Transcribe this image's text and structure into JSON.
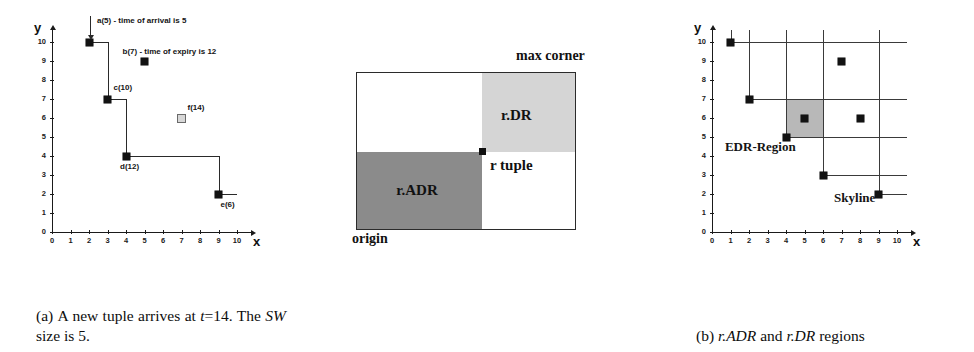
{
  "figure": {
    "panels": [
      {
        "id": "a",
        "caption_label": "(a)",
        "caption_text": "A new tuple arrives at t=14. The SW size is 5.",
        "caption_parts": [
          "(a) A new tuple ar-",
          "rives at ",
          "t",
          "=14. The ",
          "SW",
          " size is 5."
        ],
        "axes": {
          "x_label": "x",
          "y_label": "y",
          "x_ticks": [
            "0",
            "1",
            "2",
            "3",
            "4",
            "5",
            "6",
            "7",
            "8",
            "9",
            "10"
          ],
          "y_ticks": [
            "0",
            "1",
            "2",
            "3",
            "4",
            "5",
            "6",
            "7",
            "8",
            "9",
            "10"
          ],
          "xlim": [
            0,
            10
          ],
          "ylim": [
            0,
            10
          ]
        },
        "annotations": [
          {
            "name": "arrival-note",
            "text": "a(5) - time of arrival is 5"
          },
          {
            "name": "expiry-note",
            "text": "b(7) - time of expiry is 12"
          }
        ],
        "points": [
          {
            "name": "a",
            "label": "a(5)",
            "x": 2,
            "y": 10,
            "style": "filled"
          },
          {
            "name": "b",
            "label": "b(7)",
            "x": 5,
            "y": 9,
            "style": "filled"
          },
          {
            "name": "c",
            "label": "c(10)",
            "x": 3,
            "y": 7,
            "style": "filled"
          },
          {
            "name": "d",
            "label": "d(12)",
            "x": 4,
            "y": 4,
            "style": "filled"
          },
          {
            "name": "e",
            "label": "e(6)",
            "x": 9,
            "y": 2,
            "style": "filled"
          },
          {
            "name": "f",
            "label": "f(14)",
            "x": 7,
            "y": 6,
            "style": "hollow"
          }
        ],
        "skyline_path": [
          [
            2,
            10
          ],
          [
            3,
            10
          ],
          [
            3,
            7
          ],
          [
            4,
            7
          ],
          [
            4,
            4
          ],
          [
            9,
            4
          ],
          [
            9,
            2
          ],
          [
            10,
            2
          ]
        ]
      },
      {
        "id": "b",
        "caption_label": "(b)",
        "caption_text": "r.ADR and r.DR regions",
        "caption_parts": [
          "(b) ",
          "r.ADR",
          " and ",
          "r.DR",
          " regions"
        ],
        "labels": {
          "max_corner": "max corner",
          "origin": "origin",
          "r_tuple": "r tuple",
          "adr": "r.ADR",
          "dr": "r.DR"
        },
        "colors": {
          "adr_fill": "#8b8b8b",
          "dr_fill": "#d5d5d5",
          "box_border": "#2b2b2b",
          "empty_fill": "#ffffff"
        },
        "r_tuple_position": {
          "x_pct": 58,
          "y_pct": 43
        }
      },
      {
        "id": "c",
        "caption_label": "(c)",
        "caption_text": "EDR for a 2-d example",
        "caption_parts": [
          "(c) ",
          "EDR",
          " for a 2-",
          "d",
          " ex-ample"
        ],
        "axes": {
          "x_label": "x",
          "y_label": "y",
          "x_ticks": [
            "0",
            "1",
            "2",
            "3",
            "4",
            "5",
            "6",
            "7",
            "8",
            "9",
            "10"
          ],
          "y_ticks": [
            "0",
            "1",
            "2",
            "3",
            "4",
            "5",
            "6",
            "7",
            "8",
            "9",
            "10"
          ],
          "xlim": [
            0,
            10
          ],
          "ylim": [
            0,
            10
          ]
        },
        "labels": {
          "edr_region": "EDR-Region",
          "skyline": "Skyline"
        },
        "skyline_points": [
          {
            "x": 1,
            "y": 10
          },
          {
            "x": 2,
            "y": 7
          },
          {
            "x": 4,
            "y": 5
          },
          {
            "x": 6,
            "y": 3
          },
          {
            "x": 9,
            "y": 2
          }
        ],
        "other_points": [
          {
            "x": 7,
            "y": 9
          },
          {
            "x": 5,
            "y": 6
          },
          {
            "x": 8,
            "y": 6
          }
        ],
        "edr_region_extent": {
          "x0": 4,
          "x1": 6,
          "y0": 5,
          "y1": 7
        },
        "colors": {
          "edr_fill": "#b8b8b8",
          "gridline": "#3a3a3a"
        }
      }
    ]
  },
  "chart_data": [
    {
      "type": "scatter",
      "panel": "a",
      "title": "(a) A new tuple arrives at t=14. The SW size is 5.",
      "xlabel": "x",
      "ylabel": "y",
      "xlim": [
        0,
        10
      ],
      "ylim": [
        0,
        10
      ],
      "grid": false,
      "x": [
        2,
        5,
        3,
        4,
        9,
        7
      ],
      "y": [
        10,
        9,
        7,
        4,
        2,
        6
      ],
      "point_labels": [
        "a(5)",
        "b(7)",
        "c(10)",
        "d(12)",
        "e(6)",
        "f(14)"
      ],
      "annotations": [
        "a(5) - time of arrival is 5",
        "b(7) - time of expiry is 12"
      ],
      "skyline_path": [
        [
          2,
          10
        ],
        [
          3,
          10
        ],
        [
          3,
          7
        ],
        [
          4,
          7
        ],
        [
          4,
          4
        ],
        [
          9,
          4
        ],
        [
          9,
          2
        ],
        [
          10,
          2
        ]
      ]
    },
    {
      "type": "diagram",
      "panel": "b",
      "title": "(b) r.ADR and r.DR regions",
      "regions": [
        {
          "name": "r.ADR",
          "shade": "dark",
          "quadrant": "lower-left"
        },
        {
          "name": "r.DR",
          "shade": "light",
          "quadrant": "upper-right"
        }
      ],
      "annotations": [
        "max corner",
        "origin",
        "r tuple"
      ]
    },
    {
      "type": "scatter",
      "panel": "c",
      "title": "(c) EDR for a 2-d example",
      "xlabel": "x",
      "ylabel": "y",
      "xlim": [
        0,
        10
      ],
      "ylim": [
        0,
        10
      ],
      "grid": false,
      "series": [
        {
          "name": "Skyline",
          "x": [
            1,
            2,
            4,
            6,
            9
          ],
          "y": [
            10,
            7,
            5,
            3,
            2
          ]
        },
        {
          "name": "Dominated",
          "x": [
            7,
            5,
            8
          ],
          "y": [
            9,
            6,
            6
          ]
        }
      ],
      "annotations": [
        "EDR-Region",
        "Skyline"
      ],
      "shaded_region": {
        "x0": 4,
        "x1": 6,
        "y0": 5,
        "y1": 7
      }
    }
  ]
}
